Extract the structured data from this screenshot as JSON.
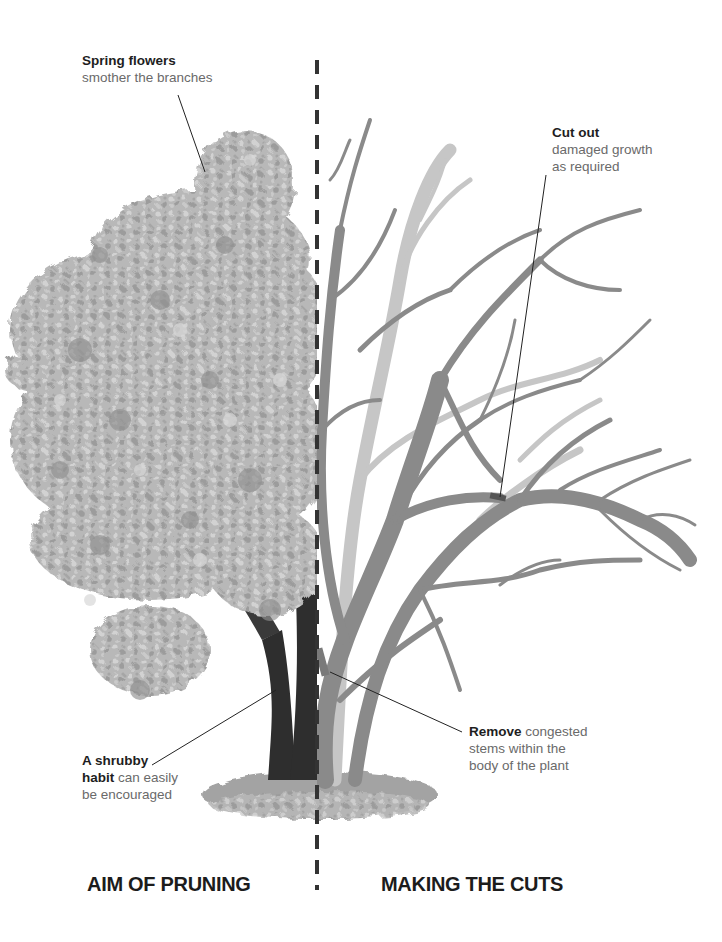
{
  "diagram": {
    "title_left": "AIM OF PRUNING",
    "title_right": "MAKING THE CUTS",
    "annotations": {
      "spring_flowers": {
        "bold": "Spring flowers",
        "text": "smother the branches"
      },
      "cut_out": {
        "bold": "Cut out",
        "line1": "damaged growth",
        "line2": "as required"
      },
      "shrubby_habit": {
        "bold1": "A shrubby",
        "bold2": "habit",
        "text1": " can easily",
        "text2": "be encouraged"
      },
      "remove": {
        "bold": "Remove",
        "text1": " congested",
        "line2": "stems within the",
        "line3": "body of the plant"
      }
    },
    "colors": {
      "blossom_light": "#c4c4c4",
      "blossom_mid": "#a8a8a8",
      "blossom_dark": "#8e8e8e",
      "trunk_dark": "#2e2e2e",
      "branch_gray": "#8a8a8a",
      "branch_light": "#c8c8c8",
      "ground": "#9a9a9a",
      "divider": "#333333",
      "leader_line": "#222222"
    }
  }
}
